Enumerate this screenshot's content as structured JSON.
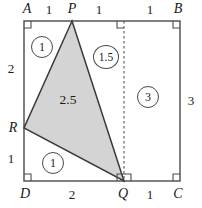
{
  "figure": {
    "square": {
      "left": 24,
      "top": 21,
      "right": 180,
      "bottom": 181
    },
    "colors": {
      "stroke": "#4a4a4a",
      "shade_fill": "#d4d4d4",
      "text": "#1a1a1a"
    },
    "vertices": {
      "A": {
        "label": "A",
        "x": 27,
        "y": 9
      },
      "B": {
        "label": "B",
        "x": 178,
        "y": 9
      },
      "C": {
        "label": "C",
        "x": 178,
        "y": 194
      },
      "D": {
        "label": "D",
        "x": 25,
        "y": 194
      },
      "P": {
        "label": "P",
        "x": 72,
        "y": 9
      },
      "Q": {
        "label": "Q",
        "x": 123,
        "y": 194
      },
      "R": {
        "label": "R",
        "x": 13,
        "y": 128
      }
    },
    "triangle": {
      "P": {
        "x": 72,
        "y": 21
      },
      "Q": {
        "x": 124,
        "y": 181
      },
      "R": {
        "x": 24,
        "y": 128
      },
      "area_label": "2.5",
      "area_label_pos": {
        "x": 68,
        "y": 100
      }
    },
    "dashed_line": {
      "x": 124,
      "y1": 21,
      "y2": 181
    },
    "edge_labels": [
      {
        "name": "top-AP",
        "text": "1",
        "x": 49,
        "y": 9
      },
      {
        "name": "top-PQ-left",
        "text": "1",
        "x": 99,
        "y": 9
      },
      {
        "name": "top-QB",
        "text": "1",
        "x": 150,
        "y": 9
      },
      {
        "name": "left-AR",
        "text": "2",
        "x": 11,
        "y": 68
      },
      {
        "name": "left-RD",
        "text": "1",
        "x": 11,
        "y": 158
      },
      {
        "name": "right-BC",
        "text": "3",
        "x": 191,
        "y": 100
      },
      {
        "name": "bottom-DQ",
        "text": "2",
        "x": 72,
        "y": 194
      },
      {
        "name": "bottom-QC",
        "text": "1",
        "x": 150,
        "y": 194
      }
    ],
    "region_labels": [
      {
        "name": "region-apr",
        "text": "1",
        "x": 42,
        "y": 47,
        "wide": false
      },
      {
        "name": "region-pqr-upper",
        "text": "1.5",
        "x": 106,
        "y": 57,
        "wide": true
      },
      {
        "name": "region-pqcb",
        "text": "3",
        "x": 148,
        "y": 97,
        "wide": false
      },
      {
        "name": "region-rdq",
        "text": "1",
        "x": 53,
        "y": 163,
        "wide": false
      }
    ],
    "right_angle_marks": [
      {
        "name": "right-angle-A",
        "x": 24,
        "y": 21,
        "dx": 1,
        "dy": 1
      },
      {
        "name": "right-angle-B",
        "x": 180,
        "y": 21,
        "dx": -1,
        "dy": 1
      },
      {
        "name": "right-angle-C",
        "x": 180,
        "y": 181,
        "dx": -1,
        "dy": -1
      },
      {
        "name": "right-angle-D",
        "x": 24,
        "y": 181,
        "dx": 1,
        "dy": -1
      },
      {
        "name": "right-angle-Q-left",
        "x": 124,
        "y": 181,
        "dx": -1,
        "dy": -1
      },
      {
        "name": "right-angle-Q-right",
        "x": 124,
        "y": 181,
        "dx": 1,
        "dy": -1
      },
      {
        "name": "right-angle-Q-top",
        "x": 124,
        "y": 21,
        "dx": -1,
        "dy": 1
      }
    ]
  }
}
